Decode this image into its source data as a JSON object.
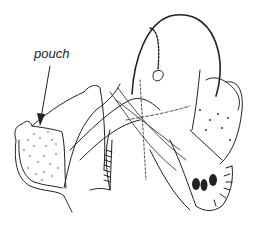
{
  "figure": {
    "type": "scientific line drawing",
    "annotations": [
      {
        "label": "pouch",
        "x": 34,
        "y": 46,
        "arrow_to": [
          40,
          124
        ]
      }
    ],
    "colors": {
      "ink": "#222222",
      "background": "#ffffff"
    }
  }
}
